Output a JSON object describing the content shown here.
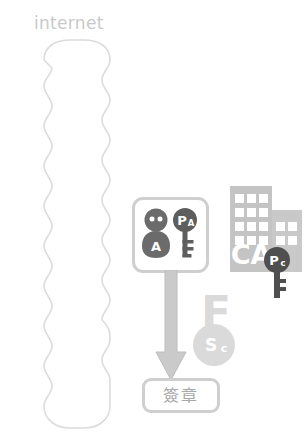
{
  "diagram": {
    "title_label": "internet",
    "cloud": {
      "name": "internet-cloud",
      "fill": "#ffffff",
      "stroke": "#dcdcdc"
    },
    "user_box": {
      "person_label": "A",
      "key_label_main": "P",
      "key_label_sub": "A",
      "icon_color": "#6b6b6b",
      "border_color": "#cfcfcf"
    },
    "ca": {
      "building_label": "CA",
      "building_color": "#c4c4c4",
      "window_color": "#ffffff",
      "key_label_main": "P",
      "key_label_sub": "c",
      "key_color": "#5e5e5e"
    },
    "signature_key": {
      "letter_label": "F",
      "circle_label_main": "S",
      "circle_label_sub": "c",
      "color": "#dadada"
    },
    "arrow": {
      "name": "flow-arrow",
      "color": "#c9c9c9"
    },
    "signature_box": {
      "label": "簽章",
      "border_color": "#cfcfcf",
      "text_color": "#a8a8a8"
    }
  }
}
